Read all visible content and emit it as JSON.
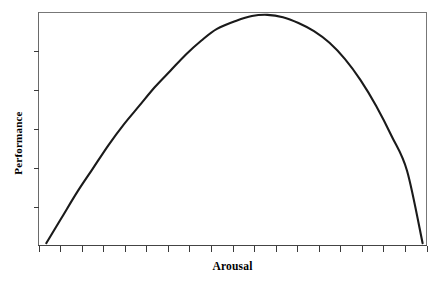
{
  "figure": {
    "name": "arousal-performance-curve",
    "background_color": "#ffffff",
    "width": 438,
    "height": 286
  },
  "chart_data": {
    "type": "line",
    "title": "",
    "subtitle": "",
    "xlabel": "Arousal",
    "ylabel": "Performance",
    "legend": [],
    "annotations": [],
    "grid": false,
    "axis_tick_labels": {
      "x": [],
      "y": []
    },
    "xlim": [
      0,
      100
    ],
    "ylim": [
      0,
      100
    ],
    "x_tick_count": 19,
    "y_tick_count": 5,
    "x_tick_values": [
      0,
      5.56,
      11.11,
      16.67,
      22.22,
      27.78,
      33.33,
      38.89,
      44.44,
      50,
      55.56,
      61.11,
      66.67,
      72.22,
      77.78,
      83.33,
      88.89,
      94.44,
      100
    ],
    "y_tick_values": [
      16.7,
      33.3,
      50,
      66.7,
      83.3
    ],
    "series": [
      {
        "name": "performance",
        "x": [
          2,
          6,
          10,
          14,
          18,
          22,
          26,
          30,
          34,
          38,
          42,
          46,
          51,
          55,
          59,
          63,
          67,
          71,
          75,
          79,
          83,
          87,
          91,
          95,
          99
        ],
        "y": [
          1,
          12,
          23,
          33,
          43,
          52,
          60,
          68,
          75,
          82,
          88,
          93,
          96.5,
          98.5,
          99,
          98,
          95.5,
          92,
          87,
          80,
          71,
          60,
          47,
          32,
          1
        ],
        "color": "#1a1a1a",
        "line_width": 2.1
      }
    ]
  },
  "axes": {
    "frame_color": "#6e6e6e",
    "frame_line_width": 1,
    "tick_color": "#3a3a3a",
    "x_axis_line_color": "#3a3a3a",
    "y_axis_line_color": "#6e6e6e"
  },
  "labels": {
    "x_axis_title": "Arousal",
    "y_axis_title": "Performance"
  }
}
